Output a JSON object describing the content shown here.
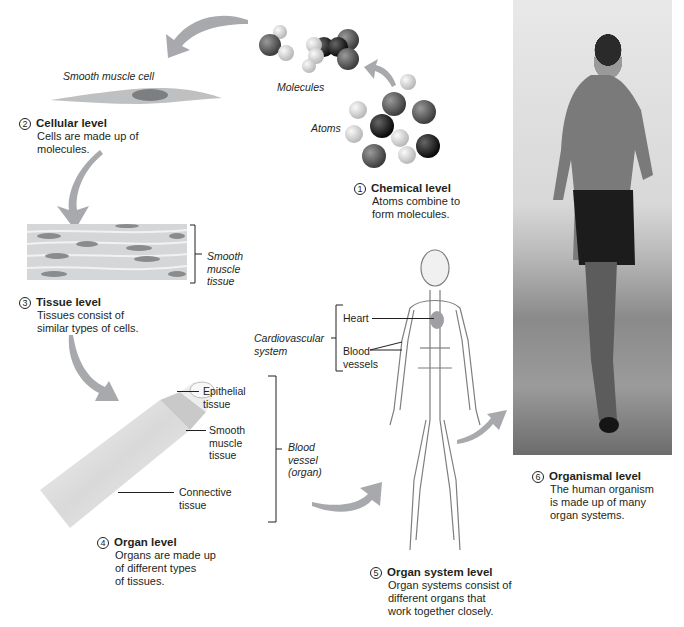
{
  "levels": [
    {
      "number": "1",
      "title": "Chemical level",
      "desc": [
        "Atoms combine to",
        "form molecules."
      ]
    },
    {
      "number": "2",
      "title": "Cellular level",
      "desc": [
        "Cells are made up of",
        "molecules."
      ]
    },
    {
      "number": "3",
      "title": "Tissue level",
      "desc": [
        "Tissues consist of",
        "similar types of cells."
      ]
    },
    {
      "number": "4",
      "title": "Organ level",
      "desc": [
        "Organs are made up",
        "of different types",
        "of tissues."
      ]
    },
    {
      "number": "5",
      "title": "Organ system level",
      "desc": [
        "Organ systems consist of",
        "different organs that",
        "work together closely."
      ]
    },
    {
      "number": "6",
      "title": "Organismal level",
      "desc": [
        "The human organism",
        "is made up of many",
        "organ systems."
      ]
    }
  ],
  "labels": {
    "smooth_muscle_cell": "Smooth muscle cell",
    "molecules": "Molecules",
    "atoms": "Atoms",
    "smooth_muscle_tissue": [
      "Smooth",
      "muscle",
      "tissue"
    ],
    "epithelial_tissue": [
      "Epithelial",
      "tissue"
    ],
    "smooth_muscle_tissue_organ": [
      "Smooth",
      "muscle",
      "tissue"
    ],
    "connective_tissue": [
      "Connective",
      "tissue"
    ],
    "blood_vessel_organ": [
      "Blood",
      "vessel",
      "(organ)"
    ],
    "cardiovascular_system": [
      "Cardiovascular",
      "system"
    ],
    "heart": "Heart",
    "blood_vessels": [
      "Blood",
      "vessels"
    ]
  },
  "colors": {
    "arrow": "#a7a9ac",
    "text": "#231f20",
    "atom_dark": "#58595b",
    "atom_black": "#1a1a1a",
    "atom_light": "#d9d9d9"
  }
}
